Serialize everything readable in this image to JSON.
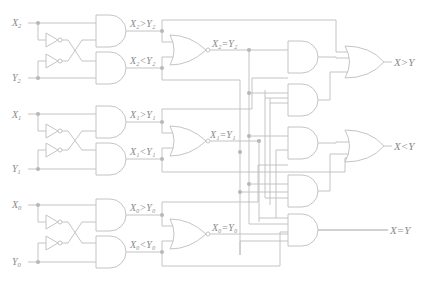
{
  "diagram": {
    "stages": [
      {
        "bit": "2",
        "x_input": "X",
        "y_input": "Y",
        "gt_label": "X₂>Y₂",
        "lt_label": "X₂<Y₂",
        "eq_label": "X₂=Y₂"
      },
      {
        "bit": "1",
        "x_input": "X",
        "y_input": "Y",
        "gt_label": "X₁>Y₁",
        "lt_label": "X₁<Y₁",
        "eq_label": "X₁=Y₁"
      },
      {
        "bit": "0",
        "x_input": "X",
        "y_input": "Y",
        "gt_label": "X₀>Y₀",
        "lt_label": "X₀<Y₀",
        "eq_label": "X₀=Y₀"
      }
    ],
    "outputs": {
      "gt": "X>Y",
      "lt": "X<Y",
      "eq": "X=Y"
    },
    "colors": {
      "wire": "#bdbdbd",
      "junction": "#b5b5b5",
      "text": "#8a8a8a",
      "background": "#ffffff"
    }
  }
}
